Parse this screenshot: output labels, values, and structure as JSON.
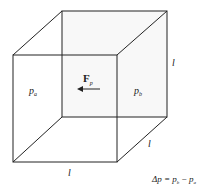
{
  "diagram": {
    "type": "cube-pressure-diagram",
    "colors": {
      "line": "#222222",
      "background": "#ffffff",
      "back_face_shade": "#f7f7f7"
    },
    "labels": {
      "left_pressure": {
        "base": "p",
        "sub": "a"
      },
      "right_pressure": {
        "base": "p",
        "sub": "b"
      },
      "force": {
        "base": "F",
        "sub": "p"
      },
      "edge_vertical": "l",
      "edge_depth": "l",
      "edge_horizontal": "l",
      "equation": {
        "prefix": "Δp = ",
        "term1": {
          "base": "p",
          "sub": "b"
        },
        "minus": " − ",
        "term2": {
          "base": "p",
          "sub": "a"
        }
      }
    },
    "arrow": {
      "direction": "left"
    }
  }
}
